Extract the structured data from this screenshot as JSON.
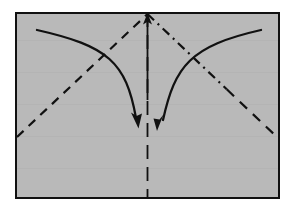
{
  "figure": {
    "kind": "origami-fold-diagram",
    "title": "",
    "caption": "",
    "canvas": {
      "width": 291,
      "height": 214
    },
    "background_color": "#ffffff"
  },
  "paper": {
    "label": "paper-sheet",
    "fill_color": "#b9b9b9",
    "stroke_color": "#111111",
    "stroke_width": 2.5,
    "x": 16,
    "y": 13,
    "width": 263,
    "height": 185
  },
  "creases": {
    "center_vertical": {
      "label": "center-vertical-crease",
      "style": "dashed",
      "stroke_color": "#111111",
      "stroke_width": 1.8,
      "dash_pattern": "14 8",
      "x": 147.5,
      "y_top": 13,
      "y_bottom": 198
    },
    "center_axis_solid": {
      "label": "center-axis-arrow-shaft",
      "style": "solid",
      "stroke_color": "#111111",
      "stroke_width": 1.8,
      "x": 147.5,
      "y_top": 15,
      "y_bottom": 100
    },
    "left_diagonal": {
      "label": "left-diagonal-valley-crease",
      "style": "dashed",
      "stroke_color": "#111111",
      "stroke_width": 2.2,
      "dash_pattern": "9 7",
      "x1": 17,
      "y1": 137,
      "x2": 147.5,
      "y2": 14
    },
    "right_diagonal": {
      "label": "right-diagonal-crease",
      "style": "dash-dot-then-dashed",
      "stroke_color": "#111111",
      "stroke_width": 2.2,
      "dash_pattern_upper": "9 5 2 5",
      "dash_pattern_lower": "10 8",
      "x1": 147.5,
      "y1": 14,
      "x2": 278,
      "y2": 138
    }
  },
  "arrows": {
    "top_axis_arrow": {
      "label": "up-arrow-center",
      "direction": "up",
      "tip_x": 147.5,
      "tip_y": 14,
      "stroke_color": "#111111"
    },
    "left_fold_arrow": {
      "label": "left-fold-arrow",
      "direction": "down-right",
      "start_x": 37,
      "start_y": 30,
      "ctrl_x": 108,
      "ctrl_y": 46,
      "tip_x": 138,
      "tip_y": 126,
      "stroke_color": "#111111",
      "stroke_width": 2.3
    },
    "right_fold_arrow": {
      "label": "right-fold-arrow",
      "direction": "down-left",
      "start_x": 261,
      "start_y": 30,
      "ctrl_x": 190,
      "ctrl_y": 46,
      "tip_x": 157,
      "tip_y": 127,
      "stroke_color": "#111111",
      "stroke_width": 2.3
    }
  },
  "legend": {
    "notes": []
  }
}
